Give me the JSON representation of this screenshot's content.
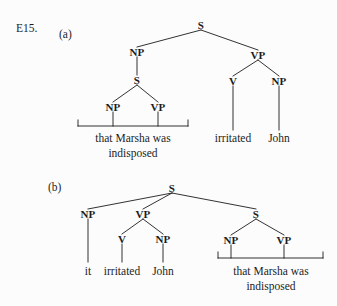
{
  "page": {
    "exercise_label": "E15.",
    "background_color": "#fcfcfc",
    "ink_color": "#1c1c1c"
  },
  "trees": [
    {
      "id": "tree-a",
      "sub_label": "(a)",
      "sub_label_pos": [
        59,
        29
      ],
      "sentence": "that Marsha was indisposed irritated John",
      "nodes": [
        {
          "name": "root-s",
          "label": "S",
          "x": 201,
          "y": 25
        },
        {
          "name": "subject-np",
          "label": "NP",
          "x": 137,
          "y": 52
        },
        {
          "name": "embedded-s",
          "label": "S",
          "x": 137,
          "y": 80
        },
        {
          "name": "embedded-np",
          "label": "NP",
          "x": 113,
          "y": 107
        },
        {
          "name": "embedded-vp",
          "label": "VP",
          "x": 158,
          "y": 107
        },
        {
          "name": "predicate-vp",
          "label": "VP",
          "x": 258,
          "y": 55
        },
        {
          "name": "verb-v",
          "label": "V",
          "x": 233,
          "y": 81
        },
        {
          "name": "object-np",
          "label": "NP",
          "x": 279,
          "y": 81
        }
      ],
      "edges": [
        [
          201,
          30,
          137,
          47
        ],
        [
          201,
          30,
          258,
          50
        ],
        [
          137,
          57,
          137,
          75
        ],
        [
          137,
          85,
          113,
          102
        ],
        [
          137,
          85,
          158,
          102
        ],
        [
          258,
          60,
          233,
          76
        ],
        [
          258,
          60,
          279,
          76
        ],
        [
          233,
          86,
          233,
          130
        ],
        [
          279,
          86,
          279,
          130
        ]
      ],
      "bracket": {
        "name": "constituent-bracket-a",
        "x1": 78,
        "x2": 188,
        "y": 126,
        "tick_height": 6,
        "stems": [
          113,
          158
        ],
        "stem_top": 112
      },
      "words": [
        {
          "name": "word-clause-line1",
          "text": "that Marsha was",
          "x": 133,
          "y": 139
        },
        {
          "name": "word-clause-line2",
          "text": "indisposed",
          "x": 133,
          "y": 154
        },
        {
          "name": "word-irritated",
          "text": "irritated",
          "x": 233,
          "y": 139
        },
        {
          "name": "word-john",
          "text": "John",
          "x": 279,
          "y": 139
        }
      ]
    },
    {
      "id": "tree-b",
      "sub_label": "(b)",
      "sub_label_pos": [
        48,
        182
      ],
      "sentence": "it irritated John that Marsha was indisposed",
      "nodes": [
        {
          "name": "root-s",
          "label": "S",
          "x": 172,
          "y": 188
        },
        {
          "name": "subject-np",
          "label": "NP",
          "x": 88,
          "y": 214
        },
        {
          "name": "predicate-vp",
          "label": "VP",
          "x": 143,
          "y": 214
        },
        {
          "name": "verb-v",
          "label": "V",
          "x": 122,
          "y": 239
        },
        {
          "name": "object-np",
          "label": "NP",
          "x": 163,
          "y": 239
        },
        {
          "name": "extraposed-s",
          "label": "S",
          "x": 256,
          "y": 214
        },
        {
          "name": "extraposed-np",
          "label": "NP",
          "x": 231,
          "y": 240
        },
        {
          "name": "extraposed-vp",
          "label": "VP",
          "x": 284,
          "y": 240
        }
      ],
      "edges": [
        [
          172,
          193,
          88,
          209
        ],
        [
          172,
          193,
          143,
          209
        ],
        [
          172,
          193,
          256,
          209
        ],
        [
          88,
          219,
          88,
          262
        ],
        [
          143,
          219,
          122,
          234
        ],
        [
          143,
          219,
          163,
          234
        ],
        [
          122,
          244,
          122,
          262
        ],
        [
          163,
          244,
          163,
          262
        ],
        [
          256,
          219,
          231,
          235
        ],
        [
          256,
          219,
          284,
          235
        ]
      ],
      "bracket": {
        "name": "constituent-bracket-b",
        "x1": 218,
        "x2": 323,
        "y": 258,
        "tick_height": 6,
        "stems": [
          231,
          284
        ],
        "stem_top": 245
      },
      "words": [
        {
          "name": "word-it",
          "text": "it",
          "x": 88,
          "y": 272
        },
        {
          "name": "word-irritated",
          "text": "irritated",
          "x": 122,
          "y": 272
        },
        {
          "name": "word-john",
          "text": "John",
          "x": 163,
          "y": 272
        },
        {
          "name": "word-clause-line1",
          "text": "that Marsha was",
          "x": 271,
          "y": 272
        },
        {
          "name": "word-clause-line2",
          "text": "indisposed",
          "x": 271,
          "y": 287
        }
      ]
    }
  ]
}
